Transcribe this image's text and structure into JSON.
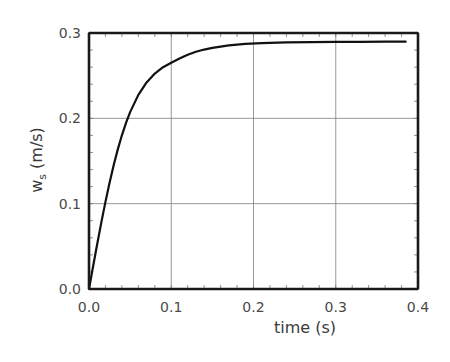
{
  "chart_data": {
    "type": "line",
    "title": "",
    "xlabel": "time (s)",
    "ylabel": "w_s (m/s)",
    "ylabel_main": "w",
    "ylabel_sub": "s",
    "ylabel_unit": " (m/s)",
    "xlim": [
      0.0,
      0.4
    ],
    "ylim": [
      0.0,
      0.3
    ],
    "grid": true,
    "legend": null,
    "x_ticks": [
      "0.0",
      "0.1",
      "0.2",
      "0.3",
      "0.4"
    ],
    "y_ticks": [
      "0.0",
      "0.1",
      "0.2",
      "0.3"
    ],
    "x_tick_values": [
      0.0,
      0.1,
      0.2,
      0.3,
      0.4
    ],
    "y_tick_values": [
      0.0,
      0.1,
      0.2,
      0.3
    ],
    "minor_tick_step_x": 0.02,
    "minor_tick_step_y": 0.02,
    "series": [
      {
        "name": "w_s",
        "color": "#111111",
        "x": [
          0.0,
          0.005,
          0.01,
          0.015,
          0.02,
          0.025,
          0.03,
          0.035,
          0.04,
          0.045,
          0.05,
          0.06,
          0.07,
          0.08,
          0.09,
          0.1,
          0.11,
          0.12,
          0.13,
          0.14,
          0.15,
          0.17,
          0.19,
          0.21,
          0.24,
          0.27,
          0.3,
          0.33,
          0.36,
          0.385
        ],
        "y": [
          0.0,
          0.0266,
          0.0528,
          0.0781,
          0.1021,
          0.1245,
          0.1451,
          0.1636,
          0.1801,
          0.1946,
          0.2073,
          0.2275,
          0.2421,
          0.2525,
          0.2599,
          0.2652,
          0.2701,
          0.2745,
          0.278,
          0.2806,
          0.2826,
          0.2855,
          0.2872,
          0.2882,
          0.289,
          0.2894,
          0.2896,
          0.2897,
          0.2898,
          0.2898
        ]
      }
    ]
  }
}
